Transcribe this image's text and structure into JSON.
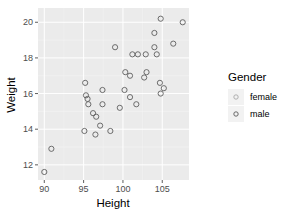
{
  "chart_data": {
    "type": "scatter",
    "title": "",
    "xlabel": "Height",
    "ylabel": "Weight",
    "xlim": [
      89.2,
      108.4
    ],
    "ylim": [
      11.15,
      20.8
    ],
    "x_ticks": [
      90,
      95,
      100,
      105
    ],
    "y_ticks": [
      12,
      14,
      16,
      18,
      20
    ],
    "grid": true,
    "legend": {
      "title": "Gender",
      "position": "right",
      "entries": [
        {
          "label": "female",
          "color": "#a8a8a8"
        },
        {
          "label": "male",
          "color": "#5a5a5a"
        }
      ]
    },
    "points": [
      {
        "x": 90.0,
        "y": 11.6
      },
      {
        "x": 90.9,
        "y": 12.9
      },
      {
        "x": 95.1,
        "y": 13.9
      },
      {
        "x": 96.5,
        "y": 13.7
      },
      {
        "x": 97.1,
        "y": 14.2
      },
      {
        "x": 98.4,
        "y": 13.9
      },
      {
        "x": 96.2,
        "y": 14.9
      },
      {
        "x": 96.6,
        "y": 14.7
      },
      {
        "x": 95.2,
        "y": 16.6
      },
      {
        "x": 95.3,
        "y": 15.9
      },
      {
        "x": 95.5,
        "y": 15.7
      },
      {
        "x": 95.6,
        "y": 15.4
      },
      {
        "x": 97.4,
        "y": 16.2
      },
      {
        "x": 97.4,
        "y": 15.4
      },
      {
        "x": 99.6,
        "y": 15.2
      },
      {
        "x": 100.2,
        "y": 16.2
      },
      {
        "x": 100.9,
        "y": 15.8
      },
      {
        "x": 101.7,
        "y": 15.4
      },
      {
        "x": 99.0,
        "y": 18.6
      },
      {
        "x": 100.3,
        "y": 17.2
      },
      {
        "x": 100.9,
        "y": 17.0
      },
      {
        "x": 102.7,
        "y": 16.9
      },
      {
        "x": 103.0,
        "y": 17.2
      },
      {
        "x": 101.2,
        "y": 18.2
      },
      {
        "x": 101.9,
        "y": 18.2
      },
      {
        "x": 102.9,
        "y": 18.2
      },
      {
        "x": 104.0,
        "y": 18.6
      },
      {
        "x": 104.3,
        "y": 18.2
      },
      {
        "x": 104.0,
        "y": 19.4
      },
      {
        "x": 104.8,
        "y": 20.2
      },
      {
        "x": 107.6,
        "y": 20.0
      },
      {
        "x": 106.4,
        "y": 18.8
      },
      {
        "x": 104.7,
        "y": 16.6
      },
      {
        "x": 105.2,
        "y": 16.3
      },
      {
        "x": 104.8,
        "y": 16.0
      }
    ],
    "point_style": {
      "shape": "hollow-circle",
      "stroke": "#5f5f5f",
      "radius": 2.6
    }
  },
  "style": {
    "panel_bg": "#ebebeb",
    "grid_major": "#ffffff",
    "grid_minor": "#f5f5f5"
  }
}
